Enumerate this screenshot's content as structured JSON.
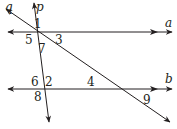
{
  "diagram": {
    "type": "parallel-lines-with-transversals",
    "lines": {
      "a": {
        "label": "a",
        "kind": "horizontal-line"
      },
      "b": {
        "label": "b",
        "kind": "horizontal-line"
      },
      "p": {
        "label": "p",
        "kind": "transversal"
      },
      "q": {
        "label": "q",
        "kind": "transversal"
      }
    },
    "angles": [
      {
        "id": "1",
        "label": "1"
      },
      {
        "id": "3",
        "label": "3"
      },
      {
        "id": "5",
        "label": "5"
      },
      {
        "id": "7",
        "label": "7"
      },
      {
        "id": "6",
        "label": "6"
      },
      {
        "id": "2",
        "label": "2"
      },
      {
        "id": "8",
        "label": "8"
      },
      {
        "id": "4",
        "label": "4"
      },
      {
        "id": "9",
        "label": "9"
      }
    ],
    "colors": {
      "stroke": "#231f20",
      "background": "#ffffff"
    }
  }
}
